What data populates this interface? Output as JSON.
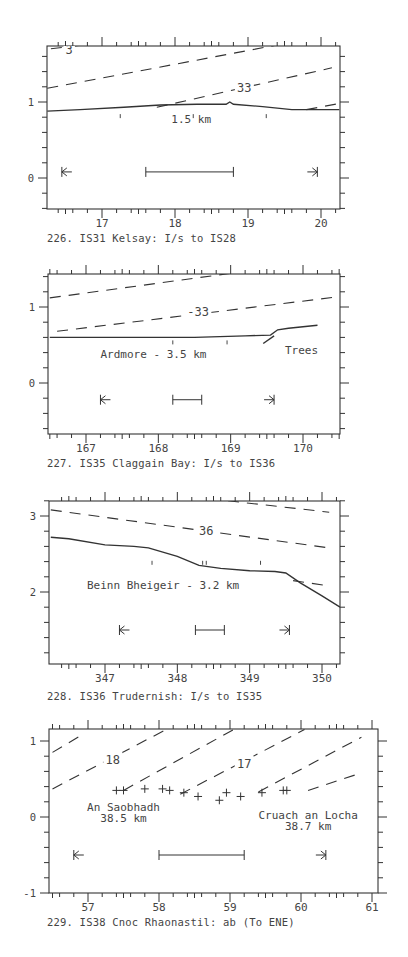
{
  "chart_data": [
    {
      "type": "line",
      "id": "226",
      "title": "226. IS31 Kelsay: I/s to IS28",
      "xlabel": "",
      "ylabel": "",
      "xlim": [
        16.25,
        20.25
      ],
      "ylim": [
        -0.4,
        1.75
      ],
      "xticks": [
        "17",
        "18",
        "19",
        "20"
      ],
      "yticks": [
        "0",
        "1"
      ],
      "grid": false,
      "frame": {
        "x0": 47,
        "x1": 340,
        "y0": 46,
        "y1": 209
      },
      "xmap": {
        "v0": 17,
        "p0": 102,
        "v1": 20,
        "p1": 321
      },
      "ymap": {
        "v0": 0,
        "p0": 178,
        "v1": 1,
        "p1": 102
      },
      "series": [
        {
          "name": "skyline profile",
          "style": "solid",
          "x": [
            16.25,
            16.7,
            17.3,
            17.8,
            18.3,
            18.7,
            18.75,
            18.8,
            19.2,
            19.6,
            20.0,
            20.25
          ],
          "y": [
            0.88,
            0.9,
            0.93,
            0.96,
            0.97,
            0.97,
            1.0,
            0.97,
            0.94,
            0.9,
            0.9,
            0.9
          ]
        },
        {
          "name": "3",
          "style": "dashed",
          "x": [
            16.3,
            17.0
          ],
          "y": [
            1.7,
            1.78
          ]
        },
        {
          "name": "upper contour",
          "style": "dashed",
          "x": [
            16.25,
            19.4
          ],
          "y": [
            1.18,
            1.75
          ]
        },
        {
          "name": "33",
          "style": "dashed",
          "x": [
            17.75,
            20.15
          ],
          "y": [
            0.93,
            1.45
          ]
        },
        {
          "name": "lower right contour",
          "style": "dashed",
          "x": [
            19.8,
            20.25
          ],
          "y": [
            0.9,
            0.98
          ]
        }
      ],
      "contour_labels": [
        {
          "text": "3",
          "x": 16.55,
          "y": 1.68
        },
        {
          "text": "33",
          "x": 18.95,
          "y": 1.18
        }
      ],
      "annotations": [
        {
          "text": "1.5 km",
          "x": 17.95,
          "y": 0.72
        }
      ],
      "markers": {
        "tick_marks_x": [
          17.25,
          18.25,
          19.25
        ],
        "tick_y": 0.88
      },
      "scale_bar": {
        "x_start": 17.6,
        "x_end": 18.8,
        "y": 0.08
      },
      "arrows": {
        "left_x": 16.45,
        "right_x": 19.95,
        "y": 0.08
      }
    },
    {
      "type": "line",
      "id": "227",
      "title": "227. IS35 Claggain Bay: I/s to IS36",
      "xlabel": "",
      "ylabel": "",
      "xlim": [
        166.5,
        170.5
      ],
      "ylim": [
        -0.65,
        1.45
      ],
      "xticks": [
        "167",
        "168",
        "169",
        "170"
      ],
      "yticks": [
        "0",
        "1"
      ],
      "grid": false,
      "frame": {
        "x0": 48,
        "x1": 340,
        "y0": 274,
        "y1": 434
      },
      "xmap": {
        "v0": 167,
        "p0": 86,
        "v1": 170,
        "p1": 303
      },
      "ymap": {
        "v0": 0,
        "p0": 383,
        "v1": 1,
        "p1": 307
      },
      "series": [
        {
          "name": "skyline profile",
          "style": "solid",
          "x": [
            166.5,
            167.5,
            168.5,
            169.2,
            169.55,
            169.65,
            169.8,
            170.0,
            170.1,
            170.2
          ],
          "y": [
            0.6,
            0.6,
            0.6,
            0.62,
            0.63,
            0.7,
            0.72,
            0.74,
            0.75,
            0.76
          ]
        },
        {
          "name": "trees edge",
          "style": "solid",
          "x": [
            169.45,
            169.6
          ],
          "y": [
            0.52,
            0.62
          ]
        },
        {
          "name": "upper contour",
          "style": "dashed",
          "x": [
            166.5,
            169.05
          ],
          "y": [
            1.12,
            1.45
          ]
        },
        {
          "name": "33",
          "style": "dashed",
          "x": [
            166.6,
            170.45
          ],
          "y": [
            0.68,
            1.13
          ]
        }
      ],
      "contour_labels": [
        {
          "text": "-33",
          "x": 168.55,
          "y": 0.93
        }
      ],
      "annotations": [
        {
          "text": "Ardmore - 3.5 km",
          "x": 167.2,
          "y": 0.33
        },
        {
          "text": "Trees",
          "x": 169.75,
          "y": 0.38
        }
      ],
      "markers": {
        "tick_marks_x": [
          168.2,
          168.95
        ],
        "tick_y": 0.6
      },
      "scale_bar": {
        "x_start": 168.2,
        "x_end": 168.6,
        "y": -0.22
      },
      "arrows": {
        "left_x": 167.2,
        "right_x": 169.6,
        "y": -0.22
      }
    },
    {
      "type": "line",
      "id": "228",
      "title": "228. IS36 Trudernish: I/s to IS35",
      "xlabel": "",
      "ylabel": "",
      "xlim": [
        346.25,
        350.25
      ],
      "ylim": [
        0.95,
        3.2
      ],
      "xticks": [
        "347",
        "348",
        "349",
        "350"
      ],
      "yticks": [
        "2",
        "3"
      ],
      "grid": false,
      "frame": {
        "x0": 49,
        "x1": 340,
        "y0": 501,
        "y1": 664
      },
      "xmap": {
        "v0": 347,
        "p0": 105,
        "v1": 350,
        "p1": 322
      },
      "ymap": {
        "v0": 2,
        "p0": 592,
        "v1": 3,
        "p1": 516
      },
      "series": [
        {
          "name": "skyline profile",
          "style": "solid",
          "x": [
            346.25,
            346.5,
            347.0,
            347.4,
            347.6,
            348.0,
            348.3,
            348.6,
            349.0,
            349.35,
            349.5,
            349.7,
            350.0,
            350.25
          ],
          "y": [
            2.72,
            2.7,
            2.62,
            2.6,
            2.58,
            2.47,
            2.35,
            2.31,
            2.28,
            2.27,
            2.25,
            2.12,
            1.95,
            1.8
          ]
        },
        {
          "name": "upper contour",
          "style": "dashed",
          "x": [
            348.7,
            350.1
          ],
          "y": [
            3.2,
            3.05
          ]
        },
        {
          "name": "36",
          "style": "dashed",
          "x": [
            346.25,
            350.1
          ],
          "y": [
            3.08,
            2.58
          ]
        },
        {
          "name": "lower contour",
          "style": "dashed",
          "x": [
            349.6,
            350.1
          ],
          "y": [
            2.15,
            2.08
          ]
        }
      ],
      "contour_labels": [
        {
          "text": "36",
          "x": 348.4,
          "y": 2.8
        }
      ],
      "annotations": [
        {
          "text": "Beinn Bheigeir - 3.2 km",
          "x": 346.75,
          "y": 2.04
        }
      ],
      "markers": {
        "tick_marks_x": [
          347.65,
          348.35,
          348.4,
          349.15
        ],
        "tick_y": 2.45
      },
      "scale_bar": {
        "x_start": 348.25,
        "x_end": 348.65,
        "y": 1.5
      },
      "arrows": {
        "left_x": 347.2,
        "right_x": 349.55,
        "y": 1.5
      }
    },
    {
      "type": "scatter",
      "id": "229",
      "title": "229. IS38 Cnoc Rhaonastil: ab (To ENE)",
      "xlabel": "",
      "ylabel": "",
      "xlim": [
        56.5,
        61.0
      ],
      "ylim": [
        -1.0,
        1.15
      ],
      "xticks": [
        "57",
        "58",
        "59",
        "60",
        "61"
      ],
      "yticks": [
        "-1",
        "0",
        "1"
      ],
      "grid": false,
      "frame": {
        "x0": 49,
        "x1": 378,
        "y0": 729,
        "y1": 893
      },
      "xmap": {
        "v0": 57,
        "p0": 88,
        "v1": 61,
        "p1": 372
      },
      "ymap": {
        "v0": 0,
        "p0": 817,
        "v1": 1,
        "p1": 741
      },
      "series": [
        {
          "name": "skyline points",
          "style": "cross",
          "x": [
            57.4,
            57.5,
            57.8,
            58.05,
            58.15,
            58.35,
            58.55,
            58.85,
            58.95,
            59.15,
            59.45,
            59.75,
            59.8
          ],
          "y": [
            0.35,
            0.35,
            0.37,
            0.37,
            0.35,
            0.32,
            0.27,
            0.22,
            0.32,
            0.27,
            0.32,
            0.35,
            0.35
          ]
        },
        {
          "name": "contour a",
          "style": "dashed",
          "x": [
            56.5,
            56.95
          ],
          "y": [
            0.85,
            1.1
          ]
        },
        {
          "name": "18",
          "style": "dashed",
          "x": [
            56.5,
            58.1
          ],
          "y": [
            0.37,
            1.15
          ]
        },
        {
          "name": "contour c",
          "style": "dashed",
          "x": [
            57.5,
            59.05
          ],
          "y": [
            0.35,
            1.15
          ]
        },
        {
          "name": "17",
          "style": "dashed",
          "x": [
            58.3,
            60.05
          ],
          "y": [
            0.3,
            1.15
          ]
        },
        {
          "name": "contour e",
          "style": "dashed",
          "x": [
            59.4,
            60.85
          ],
          "y": [
            0.33,
            1.05
          ]
        },
        {
          "name": "contour f",
          "style": "dashed",
          "x": [
            60.1,
            60.85
          ],
          "y": [
            0.35,
            0.58
          ]
        }
      ],
      "contour_labels": [
        {
          "text": "18",
          "x": 57.35,
          "y": 0.75
        },
        {
          "text": "17",
          "x": 59.2,
          "y": 0.7
        }
      ],
      "annotations": [
        {
          "text": "An Saobhadh",
          "x": 57.5,
          "y": 0.08,
          "anchor": "middle"
        },
        {
          "text": "38.5 km",
          "x": 57.5,
          "y": -0.07,
          "anchor": "middle"
        },
        {
          "text": "Cruach an Locha",
          "x": 60.1,
          "y": -0.02,
          "anchor": "middle"
        },
        {
          "text": "38.7 km",
          "x": 60.1,
          "y": -0.17,
          "anchor": "middle"
        }
      ],
      "scale_bar": {
        "x_start": 58.0,
        "x_end": 59.2,
        "y": -0.5
      },
      "arrows": {
        "left_x": 56.8,
        "right_x": 60.35,
        "y": -0.5
      }
    }
  ]
}
